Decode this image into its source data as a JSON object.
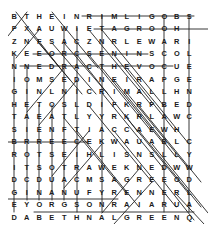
{
  "puzzle": {
    "title": "word-search-grid",
    "rows": 17,
    "cols": 16,
    "letter_color": "#1a1a1a",
    "strike_color": "#222222",
    "background_color": "#ffffff",
    "grid": [
      [
        "B",
        "T",
        "H",
        "E",
        "I",
        "N",
        "R",
        "I",
        "M",
        "L",
        "I",
        "G",
        "O",
        "B",
        "S",
        ""
      ],
      [
        "P",
        "X",
        "A",
        "U",
        "W",
        "I",
        "E",
        "T",
        "A",
        "G",
        "R",
        "O",
        "O",
        "H",
        "",
        ""
      ],
      [
        "Z",
        "N",
        "F",
        "S",
        "A",
        "C",
        "Z",
        "N",
        "R",
        "L",
        "E",
        "W",
        "A",
        "R",
        "I",
        ""
      ],
      [
        "K",
        "E",
        "E",
        "O",
        "R",
        "C",
        "S",
        "E",
        "N",
        "I",
        "N",
        "S",
        "C",
        "O",
        "L",
        ""
      ],
      [
        "N",
        "N",
        "E",
        "D",
        "R",
        "A",
        "C",
        "T",
        "H",
        "E",
        "V",
        "O",
        "C",
        "U",
        "E",
        ""
      ],
      [
        "I",
        "O",
        "M",
        "S",
        "E",
        "D",
        "I",
        "N",
        "E",
        "I",
        "R",
        "A",
        "P",
        "G",
        "E",
        ""
      ],
      [
        "G",
        "I",
        "N",
        "L",
        "N",
        "I",
        "C",
        "R",
        "I",
        "M",
        "A",
        "L",
        "L",
        "H",
        "N",
        ""
      ],
      [
        "H",
        "E",
        "T",
        "O",
        "S",
        "L",
        "D",
        "I",
        "F",
        "K",
        "R",
        "P",
        "B",
        "E",
        "D",
        ""
      ],
      [
        "T",
        "A",
        "E",
        "A",
        "T",
        "L",
        "Y",
        "Y",
        "R",
        "K",
        "R",
        "L",
        "A",
        "W",
        "C",
        ""
      ],
      [
        "S",
        "I",
        "E",
        "N",
        "F",
        "T",
        "I",
        "A",
        "C",
        "C",
        "A",
        "E",
        "W",
        "H",
        "",
        ""
      ],
      [
        "B",
        "R",
        "R",
        "E",
        "E",
        "C",
        "E",
        "K",
        "W",
        "A",
        "U",
        "A",
        "B",
        "L",
        "C",
        ""
      ],
      [
        "R",
        "O",
        "T",
        "S",
        "E",
        "I",
        "H",
        "L",
        "I",
        "S",
        "N",
        "S",
        "L",
        "L",
        "Y",
        ""
      ],
      [
        "I",
        "T",
        "S",
        "O",
        "T",
        "R",
        "A",
        "W",
        "E",
        "K",
        "N",
        "E",
        "D",
        "W",
        "W",
        ""
      ],
      [
        "D",
        "C",
        "D",
        "U",
        "A",
        "C",
        "M",
        "S",
        "A",
        "G",
        "R",
        "E",
        "E",
        "O",
        "D",
        ""
      ],
      [
        "G",
        "I",
        "N",
        "A",
        "N",
        "U",
        "F",
        "Y",
        "R",
        "E",
        "N",
        "N",
        "E",
        "R",
        "L",
        ""
      ],
      [
        "E",
        "Y",
        "O",
        "R",
        "G",
        "S",
        "O",
        "N",
        "R",
        "A",
        "I",
        "A",
        "R",
        "U",
        "A",
        ""
      ],
      [
        "D",
        "A",
        "B",
        "E",
        "T",
        "H",
        "N",
        "A",
        "L",
        "G",
        "R",
        "E",
        "E",
        "N",
        "Q",
        ""
      ]
    ],
    "strikes": [
      {
        "name": "strike-row-1-across",
        "x1": 74,
        "y1": 6,
        "x2": 186,
        "y2": 6
      },
      {
        "name": "strike-row-2-across",
        "x1": 86,
        "y1": 19,
        "x2": 200,
        "y2": 19
      },
      {
        "name": "strike-row-4-across",
        "x1": 25,
        "y1": 44,
        "x2": 140,
        "y2": 44
      },
      {
        "name": "strike-row-5-across",
        "x1": 12,
        "y1": 56,
        "x2": 165,
        "y2": 56
      },
      {
        "name": "strike-row-11-across",
        "x1": 0,
        "y1": 132,
        "x2": 80,
        "y2": 132
      },
      {
        "name": "strike-row-16-across",
        "x1": 0,
        "y1": 189,
        "x2": 110,
        "y2": 189
      },
      {
        "name": "strike-row-17-across",
        "x1": 26,
        "y1": 202,
        "x2": 186,
        "y2": 202
      },
      {
        "name": "strike-col-1-down",
        "x1": 6,
        "y1": 44,
        "x2": 6,
        "y2": 202
      },
      {
        "name": "strike-col-2-down",
        "x1": 19,
        "y1": 57,
        "x2": 19,
        "y2": 190
      },
      {
        "name": "strike-col-3-down",
        "x1": 31,
        "y1": 95,
        "x2": 31,
        "y2": 190
      },
      {
        "name": "strike-col-4-down",
        "x1": 44,
        "y1": 95,
        "x2": 44,
        "y2": 190
      },
      {
        "name": "strike-col-5-down",
        "x1": 56,
        "y1": 18,
        "x2": 56,
        "y2": 190
      },
      {
        "name": "strike-col-6-down",
        "x1": 69,
        "y1": 18,
        "x2": 69,
        "y2": 202
      },
      {
        "name": "strike-col-8-down",
        "x1": 94,
        "y1": 5,
        "x2": 94,
        "y2": 202
      },
      {
        "name": "strike-col-13-down",
        "x1": 156,
        "y1": 5,
        "x2": 156,
        "y2": 202
      },
      {
        "name": "strike-col-15-down",
        "x1": 181,
        "y1": 5,
        "x2": 181,
        "y2": 202
      },
      {
        "name": "strike-diag-a",
        "x1": 8,
        "y1": 2,
        "x2": 52,
        "y2": 58
      },
      {
        "name": "strike-diag-b",
        "x1": 44,
        "y1": 2,
        "x2": 90,
        "y2": 58
      },
      {
        "name": "strike-diag-c",
        "x1": 20,
        "y1": 20,
        "x2": 62,
        "y2": 70
      },
      {
        "name": "strike-diag-d",
        "x1": 31,
        "y1": 33,
        "x2": 74,
        "y2": 84
      },
      {
        "name": "strike-diag-e",
        "x1": 44,
        "y1": 33,
        "x2": 88,
        "y2": 84
      },
      {
        "name": "strike-diag-f",
        "x1": 56,
        "y1": 33,
        "x2": 100,
        "y2": 84
      },
      {
        "name": "strike-diag-g",
        "x1": 69,
        "y1": 45,
        "x2": 130,
        "y2": 122
      },
      {
        "name": "strike-diag-h",
        "x1": 81,
        "y1": 20,
        "x2": 144,
        "y2": 96
      },
      {
        "name": "strike-diag-i",
        "x1": 94,
        "y1": 20,
        "x2": 156,
        "y2": 96
      },
      {
        "name": "strike-diag-j",
        "x1": 81,
        "y1": 45,
        "x2": 144,
        "y2": 122
      },
      {
        "name": "strike-diag-k",
        "x1": 94,
        "y1": 58,
        "x2": 156,
        "y2": 134
      },
      {
        "name": "strike-diag-l",
        "x1": 106,
        "y1": 45,
        "x2": 168,
        "y2": 122
      },
      {
        "name": "strike-diag-m",
        "x1": 119,
        "y1": 58,
        "x2": 181,
        "y2": 134
      },
      {
        "name": "strike-diag-n",
        "x1": 106,
        "y1": 70,
        "x2": 168,
        "y2": 147
      },
      {
        "name": "strike-diag-o",
        "x1": 94,
        "y1": 83,
        "x2": 156,
        "y2": 159
      },
      {
        "name": "strike-diag-p",
        "x1": 81,
        "y1": 96,
        "x2": 144,
        "y2": 172
      },
      {
        "name": "strike-diag-q",
        "x1": 119,
        "y1": 83,
        "x2": 181,
        "y2": 159
      },
      {
        "name": "strike-diag-r",
        "x1": 131,
        "y1": 96,
        "x2": 193,
        "y2": 172
      },
      {
        "name": "strike-diag-s",
        "x1": 119,
        "y1": 108,
        "x2": 181,
        "y2": 184
      },
      {
        "name": "strike-diag-t",
        "x1": 106,
        "y1": 121,
        "x2": 168,
        "y2": 197
      },
      {
        "name": "strike-diag-u",
        "x1": 131,
        "y1": 121,
        "x2": 193,
        "y2": 197
      },
      {
        "name": "strike-diag-v",
        "x1": 144,
        "y1": 134,
        "x2": 200,
        "y2": 203
      },
      {
        "name": "strike-diag-w",
        "x1": 56,
        "y1": 108,
        "x2": 119,
        "y2": 184
      },
      {
        "name": "strike-diag-x",
        "x1": 69,
        "y1": 121,
        "x2": 131,
        "y2": 197
      },
      {
        "name": "strike-diag-y",
        "x1": 131,
        "y1": 159,
        "x2": 94,
        "y2": 203
      },
      {
        "name": "strike-diag-z",
        "x1": 144,
        "y1": 172,
        "x2": 106,
        "y2": 214
      },
      {
        "name": "strike-diag-aa",
        "x1": 19,
        "y1": 2,
        "x2": 0,
        "y2": 26
      },
      {
        "name": "strike-diag-ab",
        "x1": 56,
        "y1": 58,
        "x2": 19,
        "y2": 102
      },
      {
        "name": "strike-diag-ac",
        "x1": 69,
        "y1": 70,
        "x2": 31,
        "y2": 115
      },
      {
        "name": "strike-diag-ad",
        "x1": 81,
        "y1": 121,
        "x2": 44,
        "y2": 166
      },
      {
        "name": "strike-diag-ae",
        "x1": 94,
        "y1": 134,
        "x2": 56,
        "y2": 178
      },
      {
        "name": "strike-diag-af",
        "x1": 31,
        "y1": 20,
        "x2": 8,
        "y2": 48
      },
      {
        "name": "strike-diag-ag",
        "x1": 156,
        "y1": 172,
        "x2": 186,
        "y2": 210
      },
      {
        "name": "strike-diag-ah",
        "x1": 168,
        "y1": 184,
        "x2": 196,
        "y2": 214
      }
    ]
  }
}
